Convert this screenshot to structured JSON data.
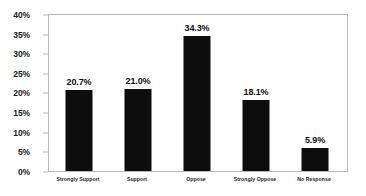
{
  "chart_data": {
    "type": "bar",
    "title": "",
    "subtitle": "",
    "xlabel": "",
    "ylabel": "",
    "categories": [
      "Strongly Support",
      "Support",
      "Oppose",
      "Strongly Oppose",
      "No Response"
    ],
    "values": [
      20.7,
      21.0,
      34.3,
      18.1,
      5.9
    ],
    "value_labels": [
      "20.7%",
      "21.0%",
      "34.3%",
      "18.1%",
      "5.9%"
    ],
    "ylim": [
      0,
      40
    ],
    "ytick_values": [
      0,
      5,
      10,
      15,
      20,
      25,
      30,
      35,
      40
    ],
    "ytick_labels": [
      "0%",
      "5%",
      "10%",
      "15%",
      "20%",
      "25%",
      "30%",
      "35%",
      "40%"
    ],
    "grid": false,
    "legend": null,
    "legend_position": "none",
    "bar_color": "#0d0d0d",
    "plot_border_color": "#b9b9b9",
    "background_color": "#ffffff"
  }
}
